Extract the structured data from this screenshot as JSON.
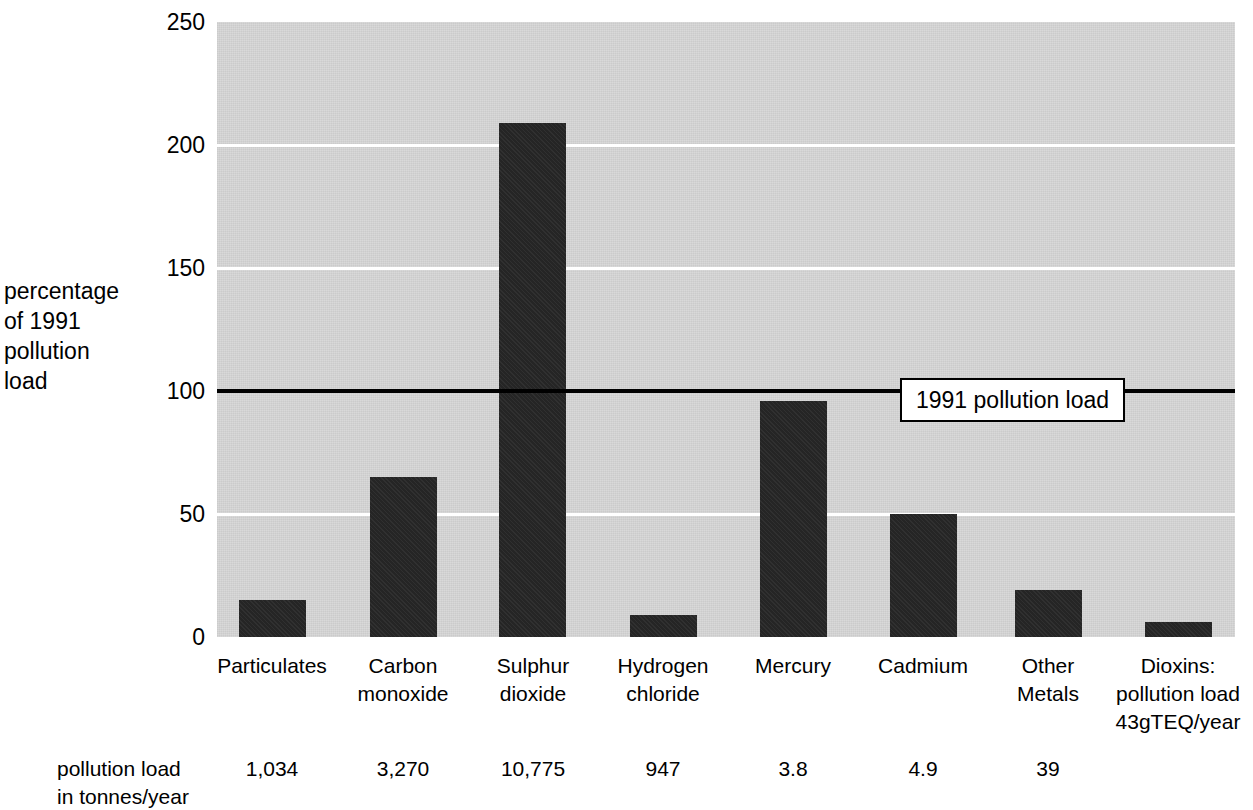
{
  "chart_data": {
    "type": "bar",
    "title": "",
    "ylabel": "percentage\nof 1991\npollution\nload",
    "xlabel": "",
    "ylim": [
      0,
      250
    ],
    "yticks": [
      0,
      50,
      100,
      150,
      200,
      250
    ],
    "ytick_labels": [
      "0",
      "50",
      "100",
      "150",
      "200",
      "250"
    ],
    "grid": true,
    "grid_axis": "y",
    "legend": null,
    "categories": [
      "Particulates",
      "Carbon\nmonoxide",
      "Sulphur\ndioxide",
      "Hydrogen\nchloride",
      "Mercury",
      "Cadmium",
      "Other\nMetals",
      "Dioxins:\npollution load\n43gTEQ/year"
    ],
    "values": [
      15,
      65,
      209,
      9,
      96,
      50,
      19,
      6
    ],
    "annotations": [
      {
        "text": "1991 pollution load",
        "y_value": 100,
        "style": "horizontal-reference-line-with-boxed-label"
      }
    ],
    "secondary_row": {
      "label": "pollution load\nin tonnes/year",
      "values": [
        "1,034",
        "3,270",
        "10,775",
        "947",
        "3.8",
        "4.9",
        "39",
        ""
      ]
    },
    "colors": {
      "bar": "#252525",
      "plot_background": "#d2d2d2",
      "gridline": "#ffffff",
      "reference_line": "#000000",
      "text": "#000000",
      "page_background": "#ffffff"
    }
  },
  "geometry": {
    "plot": {
      "left": 217,
      "top": 22,
      "width": 1018,
      "height": 615
    },
    "bar_width": 67,
    "bar_left_positions": [
      239,
      370,
      499,
      630,
      760,
      890,
      1015,
      1145
    ],
    "category_centers": [
      272,
      403,
      533,
      663,
      793,
      923,
      1048,
      1178
    ]
  }
}
